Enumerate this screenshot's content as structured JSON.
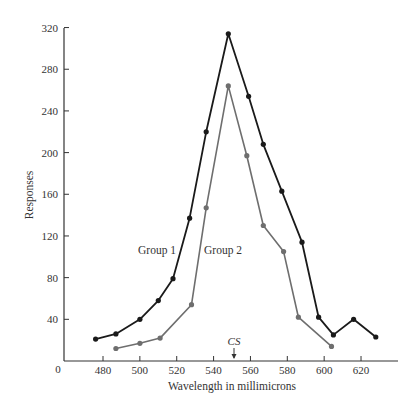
{
  "chart_data": {
    "type": "line",
    "title": "",
    "xlabel": "Wavelength in millimicrons",
    "ylabel": "Responses",
    "xlim": [
      465,
      640
    ],
    "ylim": [
      0,
      320
    ],
    "x_ticks": [
      480,
      500,
      520,
      540,
      560,
      580,
      600,
      620
    ],
    "y_ticks": [
      40,
      80,
      120,
      160,
      200,
      240,
      280,
      320
    ],
    "origin_label": "0",
    "grid": false,
    "legend": "inline labels",
    "annotations": [
      {
        "text": "CS",
        "x": 550,
        "type": "arrow",
        "note": "conditioned stimulus wavelength"
      },
      {
        "text": "Group 1",
        "series": "Group 1"
      },
      {
        "text": "Group 2",
        "series": "Group 2"
      }
    ],
    "series": [
      {
        "name": "Group 1",
        "color": "#1a1a1a",
        "points": [
          [
            476,
            21
          ],
          [
            487,
            26
          ],
          [
            500,
            40
          ],
          [
            510,
            58
          ],
          [
            518,
            79
          ],
          [
            527,
            137
          ],
          [
            536,
            220
          ],
          [
            548,
            314
          ],
          [
            559,
            254
          ],
          [
            567,
            208
          ],
          [
            577,
            163
          ],
          [
            588,
            114
          ],
          [
            597,
            42
          ],
          [
            605,
            25
          ],
          [
            616,
            40
          ],
          [
            628,
            23
          ]
        ]
      },
      {
        "name": "Group 2",
        "color": "#6e6e6e",
        "points": [
          [
            487,
            12
          ],
          [
            500,
            17
          ],
          [
            511,
            22
          ],
          [
            528,
            54
          ],
          [
            536,
            147
          ],
          [
            548,
            264
          ],
          [
            558,
            197
          ],
          [
            567,
            130
          ],
          [
            578,
            105
          ],
          [
            586,
            42
          ],
          [
            604,
            14
          ]
        ]
      }
    ]
  },
  "labels": {
    "xlabel": "Wavelength in millimicrons",
    "ylabel": "Responses",
    "origin": "0",
    "cs": "CS",
    "group1": "Group 1",
    "group2": "Group 2"
  }
}
